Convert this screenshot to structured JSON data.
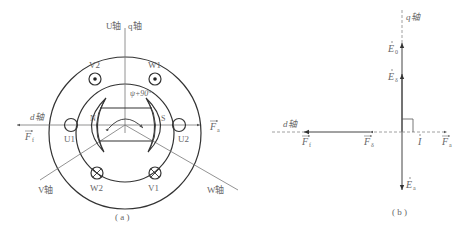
{
  "figure_a": {
    "caption": "( a )",
    "axes": {
      "u_axis": "U轴",
      "q_axis": "q轴",
      "d_axis": "d轴",
      "v_axis": "V轴",
      "w_axis": "W轴"
    },
    "angle_label": "ψ+90°",
    "windings": {
      "top_left": "V2",
      "top_right": "W1",
      "left": "U1",
      "right": "U2",
      "bottom_left": "W2",
      "bottom_right": "V1"
    },
    "poles": {
      "north": "N",
      "south": "S"
    },
    "vectors": {
      "left": "F",
      "left_sub": "f",
      "right": "F",
      "right_sub": "a"
    }
  },
  "figure_b": {
    "caption": "( b )",
    "axes": {
      "q_axis": "q轴",
      "d_axis": "d轴"
    },
    "phasors": [
      {
        "name": "E",
        "sub": "0",
        "direction": "up"
      },
      {
        "name": "E",
        "sub": "δ",
        "direction": "up"
      },
      {
        "name": "E",
        "sub": "a",
        "direction": "down"
      },
      {
        "name": "I",
        "sub": "",
        "direction": "right"
      }
    ],
    "vectors": [
      {
        "name": "F",
        "sub": "f",
        "direction": "left"
      },
      {
        "name": "F",
        "sub": "δ",
        "direction": "left"
      },
      {
        "name": "F",
        "sub": "a",
        "direction": "right"
      }
    ]
  },
  "colors": {
    "line": "#333333",
    "label": "#666666",
    "background": "#ffffff"
  }
}
